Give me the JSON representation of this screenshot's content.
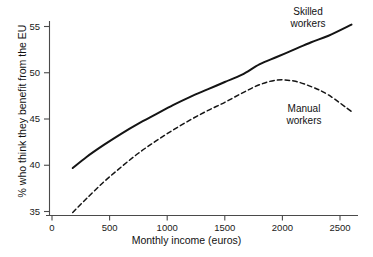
{
  "chart_data": {
    "type": "line",
    "title": "",
    "subtitle": "",
    "xlabel": "Monthly income (euros)",
    "ylabel": "% who think they benefit from the EU",
    "xlim": [
      0,
      2700
    ],
    "ylim": [
      34.2,
      56.2
    ],
    "xticks": [
      0,
      500,
      1000,
      1500,
      2000,
      2500
    ],
    "xtick_labels": [
      "0",
      "500",
      "1000",
      "1500",
      "2000",
      "2500"
    ],
    "yticks": [
      35,
      40,
      45,
      50,
      55
    ],
    "ytick_labels": [
      "35",
      "40",
      "45",
      "50",
      "55"
    ],
    "grid": false,
    "legend_position": "inline-annotations",
    "series": [
      {
        "name": "Skilled workers",
        "style": "solid",
        "color": "#141414",
        "linewidth": 2.0,
        "annotation": {
          "line1": "Skilled",
          "line2": "workers"
        },
        "x": [
          180,
          300,
          450,
          600,
          750,
          900,
          1050,
          1200,
          1350,
          1500,
          1650,
          1800,
          1950,
          2100,
          2250,
          2400,
          2600
        ],
        "y": [
          39.7,
          40.9,
          42.2,
          43.4,
          44.5,
          45.5,
          46.5,
          47.4,
          48.2,
          49.0,
          49.8,
          50.9,
          51.7,
          52.5,
          53.3,
          54.0,
          55.2
        ]
      },
      {
        "name": "Manual workers",
        "style": "dashed",
        "color": "#141414",
        "linewidth": 1.5,
        "annotation": {
          "line1": "Manual",
          "line2": "workers"
        },
        "x": [
          180,
          300,
          450,
          600,
          750,
          900,
          1050,
          1200,
          1350,
          1500,
          1650,
          1800,
          1950,
          2100,
          2250,
          2400,
          2600
        ],
        "y": [
          34.9,
          36.4,
          38.2,
          39.8,
          41.3,
          42.6,
          43.8,
          44.9,
          45.9,
          46.8,
          47.8,
          48.7,
          49.2,
          49.1,
          48.5,
          47.6,
          45.8
        ]
      }
    ]
  },
  "axes": {
    "x_title": "Monthly income (euros)",
    "y_title": "% who think they benefit from the EU"
  },
  "colors": {
    "background": "#ffffff",
    "axis": "#4a4a4a",
    "ink": "#141414",
    "text": "#111111"
  }
}
